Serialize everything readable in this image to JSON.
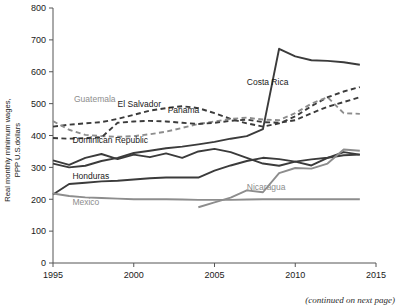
{
  "chart_data": {
    "type": "line",
    "title": "",
    "xlabel": "",
    "ylabel": "Real monthly minimum wages, PPP U.S.dollars",
    "xlim": [
      1995,
      2015
    ],
    "ylim": [
      0,
      800
    ],
    "xticks": [
      1995,
      2000,
      2005,
      2010,
      2015
    ],
    "yticks": [
      0,
      100,
      200,
      300,
      400,
      500,
      600,
      700,
      800
    ],
    "grid": false,
    "legend": "inline-labels",
    "annotation": "(continued on next page)",
    "series": [
      {
        "name": "Costa Rica",
        "style": "solid",
        "color": "#3b3b3b",
        "label_x": 2007.0,
        "label_y": 560,
        "x": [
          1995,
          1996,
          1997,
          1998,
          1999,
          2000,
          2001,
          2002,
          2003,
          2004,
          2005,
          2006,
          2007,
          2008,
          2009,
          2010,
          2011,
          2012,
          2013,
          2014
        ],
        "values": [
          312,
          300,
          305,
          320,
          330,
          345,
          352,
          360,
          365,
          372,
          380,
          390,
          398,
          420,
          672,
          648,
          636,
          634,
          630,
          622
        ]
      },
      {
        "name": "Panama",
        "style": "dashed",
        "color": "#3b3b3b",
        "label_x": 2002.1,
        "label_y": 470,
        "x": [
          1995,
          1996,
          1997,
          1998,
          1999,
          2000,
          2001,
          2002,
          2003,
          2004,
          2005,
          2006,
          2007,
          2008,
          2009,
          2010,
          2011,
          2012,
          2013,
          2014
        ],
        "values": [
          428,
          434,
          438,
          442,
          452,
          465,
          478,
          486,
          492,
          486,
          470,
          452,
          438,
          428,
          438,
          460,
          492,
          520,
          538,
          552
        ]
      },
      {
        "name": "Guatemala",
        "style": "dashed",
        "color": "#8d8d8d",
        "label_x": 1996.3,
        "label_y": 505,
        "x": [
          1995,
          1996,
          1997,
          1998,
          1999,
          2000,
          2001,
          2002,
          2003,
          2004,
          2005,
          2006,
          2007,
          2008,
          2009,
          2010,
          2011,
          2012,
          2013,
          2014
        ],
        "values": [
          445,
          418,
          402,
          398,
          396,
          398,
          404,
          412,
          424,
          436,
          444,
          452,
          456,
          450,
          448,
          470,
          500,
          520,
          470,
          468
        ]
      },
      {
        "name": "El Salvador",
        "style": "dashed",
        "color": "#3b3b3b",
        "label_x": 1999.0,
        "label_y": 490,
        "x": [
          1995,
          1996,
          1997,
          1998,
          1999,
          2000,
          2001,
          2002,
          2003,
          2004,
          2005,
          2006,
          2007,
          2008,
          2009,
          2010,
          2011,
          2012,
          2013,
          2014
        ],
        "values": [
          392,
          390,
          392,
          394,
          440,
          444,
          446,
          444,
          440,
          436,
          440,
          446,
          450,
          442,
          440,
          448,
          470,
          490,
          505,
          520
        ]
      },
      {
        "name": "Dominican Republic",
        "style": "solid",
        "color": "#3b3b3b",
        "label_x": 1996.2,
        "label_y": 378,
        "x": [
          1995,
          1996,
          1997,
          1998,
          1999,
          2000,
          2001,
          2002,
          2003,
          2004,
          2005,
          2006,
          2007,
          2008,
          2009,
          2010,
          2011,
          2012,
          2013,
          2014
        ],
        "values": [
          322,
          308,
          330,
          342,
          326,
          340,
          332,
          344,
          330,
          350,
          358,
          348,
          330,
          312,
          305,
          318,
          306,
          330,
          348,
          340
        ]
      },
      {
        "name": "Honduras",
        "style": "solid",
        "color": "#3b3b3b",
        "label_x": 1996.2,
        "label_y": 262,
        "x": [
          1995,
          1996,
          1997,
          1998,
          1999,
          2000,
          2001,
          2002,
          2003,
          2004,
          2005,
          2006,
          2007,
          2008,
          2009,
          2010,
          2011,
          2012,
          2013,
          2014
        ],
        "values": [
          215,
          248,
          252,
          256,
          258,
          262,
          266,
          268,
          268,
          268,
          290,
          306,
          320,
          330,
          326,
          318,
          325,
          330,
          338,
          340
        ]
      },
      {
        "name": "Nicaragua",
        "style": "solid",
        "color": "#8d8d8d",
        "label_x": 2007.0,
        "label_y": 228,
        "x": [
          2004,
          2005,
          2006,
          2007,
          2008,
          2009,
          2010,
          2011,
          2012,
          2013,
          2014
        ],
        "values": [
          175,
          190,
          205,
          228,
          222,
          282,
          298,
          296,
          312,
          356,
          352
        ]
      },
      {
        "name": "Mexico",
        "style": "solid",
        "color": "#8d8d8d",
        "label_x": 1996.2,
        "label_y": 182,
        "x": [
          1995,
          1996,
          1997,
          1998,
          1999,
          2000,
          2001,
          2002,
          2003,
          2004,
          2005,
          2006,
          2007,
          2008,
          2009,
          2010,
          2011,
          2012,
          2013,
          2014
        ],
        "values": [
          218,
          210,
          206,
          204,
          202,
          200,
          200,
          200,
          199,
          198,
          198,
          198,
          199,
          200,
          200,
          200,
          200,
          200,
          200,
          200
        ]
      }
    ]
  }
}
